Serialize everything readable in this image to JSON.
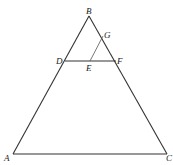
{
  "diagram": {
    "type": "geometry",
    "points": {
      "A": {
        "label": "A",
        "x": 13,
        "y": 154
      },
      "B": {
        "label": "B",
        "x": 89,
        "y": 16
      },
      "C": {
        "label": "C",
        "x": 167,
        "y": 154
      },
      "D": {
        "label": "D",
        "x": 65,
        "y": 61
      },
      "E": {
        "label": "E",
        "x": 90,
        "y": 61
      },
      "F": {
        "label": "F",
        "x": 116,
        "y": 61
      },
      "G": {
        "label": "G",
        "x": 103,
        "y": 36
      }
    },
    "segments": [
      "AB",
      "BC",
      "AC",
      "DF",
      "EG"
    ]
  }
}
